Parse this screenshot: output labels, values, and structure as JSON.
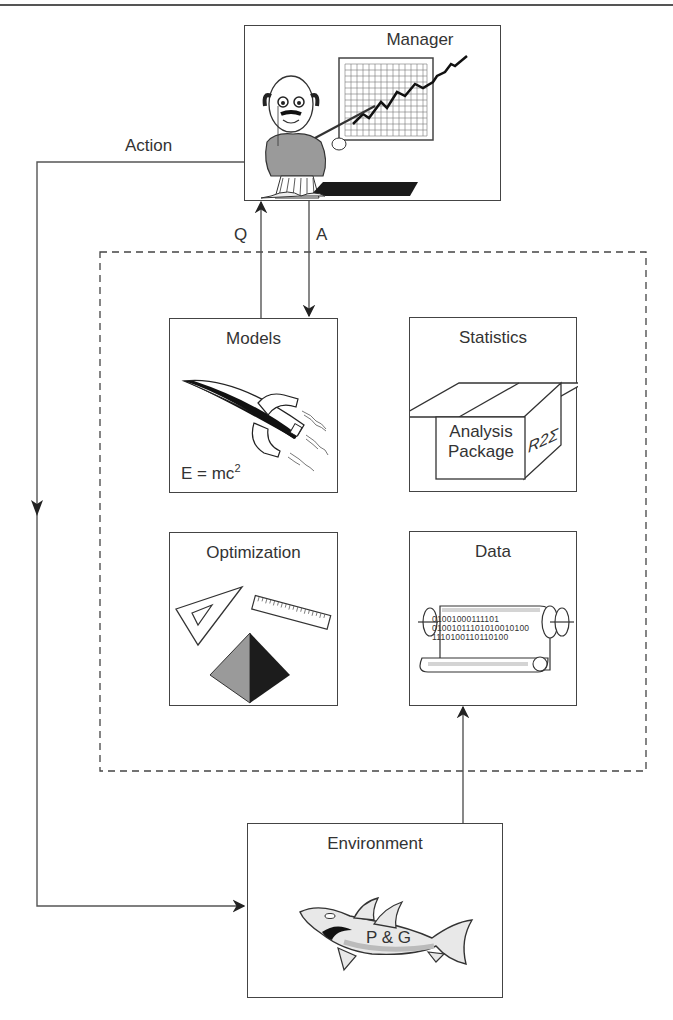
{
  "diagram": {
    "nodes": {
      "manager": {
        "title": "Manager",
        "icon": "manager-presenting-chart-icon"
      },
      "models": {
        "title": "Models",
        "icon": "rocket-icon",
        "equation_base": "E = mc",
        "equation_exp": "2"
      },
      "statistics": {
        "title": "Statistics",
        "icon": "box-package-icon",
        "package_line1": "Analysis",
        "package_line2": "Package",
        "package_side": "R2Σ"
      },
      "optimization": {
        "title": "Optimization",
        "icon": "geometry-tools-icon"
      },
      "data": {
        "title": "Data",
        "icon": "scroll-icon",
        "binary_lines": [
          "01001000111101",
          "01001011101010010100",
          "1110100110110100"
        ]
      },
      "environment": {
        "title": "Environment",
        "icon": "shark-icon",
        "shark_label": "P & G"
      }
    },
    "edges": {
      "action": {
        "label": "Action",
        "from": "manager",
        "to": "environment"
      },
      "q": {
        "label": "Q",
        "from": "models",
        "to": "manager"
      },
      "a": {
        "label": "A",
        "from": "manager",
        "to": "models"
      },
      "env_to_data": {
        "label": "",
        "from": "environment",
        "to": "data"
      }
    },
    "group": {
      "style": "dashed",
      "members": [
        "models",
        "statistics",
        "optimization",
        "data"
      ]
    }
  },
  "colors": {
    "line": "#444444",
    "gray_fill": "#9a9a9a",
    "dark_fill": "#222222",
    "light_gray": "#d4d4d4"
  }
}
